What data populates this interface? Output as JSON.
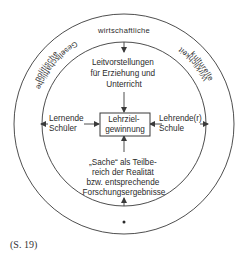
{
  "diagram": {
    "outer_ring_labels": {
      "top": "wirtschaftliche",
      "upper_left": "politische",
      "upper_right": "kulturelle",
      "lower_left": "Gesellschaftliche",
      "lower_right": "Wirklichkeit"
    },
    "inner": {
      "top_text": [
        "Leitvorstellungen",
        "für Erziehung und",
        "Unterricht"
      ],
      "center_box": [
        "Lehrziel-",
        "gewinnung"
      ],
      "left_text": [
        "Lernende",
        "Schüler"
      ],
      "right_text": [
        "Lehrende(r)",
        "Schule"
      ],
      "bottom_text": [
        "„Sache“ als Teilbe-",
        "reich der Realität",
        "bzw. entsprechende",
        "Forschungsergebnisse"
      ]
    },
    "colors": {
      "line": "#3a3a3a",
      "text": "#2a2a2a",
      "background": "#ffffff"
    }
  },
  "caption": "(S. 19)"
}
